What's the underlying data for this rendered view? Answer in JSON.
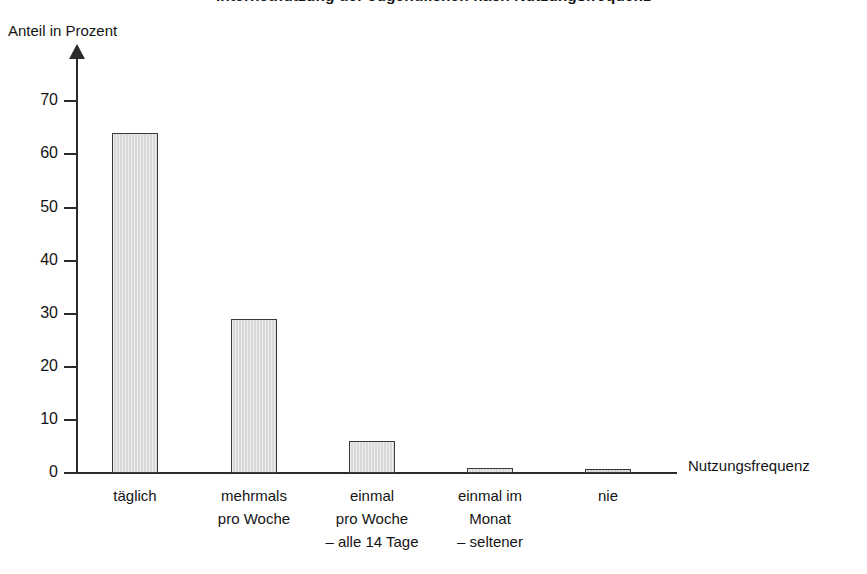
{
  "chart_data": {
    "type": "bar",
    "title": "Internetnutzung der Jugendlichen nach Nutzungsfrequenz",
    "ylabel": "Anteil in Prozent",
    "xlabel": "Nutzungsfrequenz",
    "categories": [
      "täglich",
      "mehrmals\npro Woche",
      "einmal\npro Woche\n– alle 14 Tage",
      "einmal im\nMonat\n– seltener",
      "nie"
    ],
    "values": [
      64,
      29,
      6,
      1,
      0.3
    ],
    "ylim": [
      0,
      75
    ],
    "yticks": [
      0,
      10,
      20,
      30,
      40,
      50,
      60,
      70
    ],
    "ytick_labels": [
      "0",
      "10",
      "20",
      "30",
      "40",
      "50",
      "60",
      "70"
    ],
    "grid": false,
    "legend": "none",
    "bar_fill_color": "#d9d9d9",
    "bar_border_color": "#3a3a3a",
    "axis_color": "#2b2b2b",
    "background_color": "#ffffff"
  }
}
